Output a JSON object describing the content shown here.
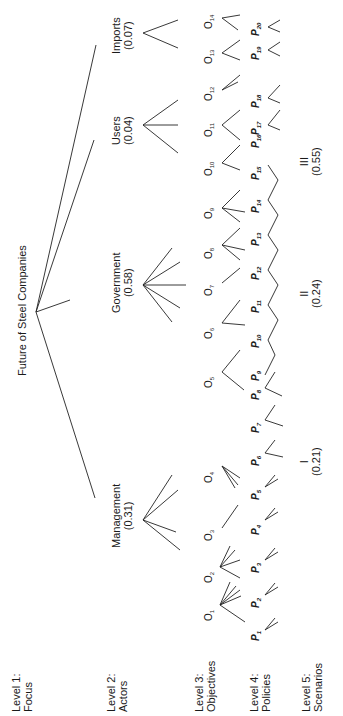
{
  "levels": [
    {
      "title": "Level 1:",
      "name": "Focus"
    },
    {
      "title": "Level 2:",
      "name": "Actors"
    },
    {
      "title": "Level 3:",
      "name": "Objectives"
    },
    {
      "title": "Level 4:",
      "name": "Policies"
    },
    {
      "title": "Level 5:",
      "name": "Scenarios"
    }
  ],
  "focus": {
    "label": "Future of Steel Companies"
  },
  "actors": [
    {
      "name": "Management",
      "weight": "(0.31)"
    },
    {
      "name": "Government",
      "weight": "(0.58)"
    },
    {
      "name": "Users",
      "weight": "(0.04)"
    },
    {
      "name": "Imports",
      "weight": "(0.07)"
    }
  ],
  "objectives": [
    "1",
    "2",
    "3",
    "4",
    "5",
    "6",
    "7",
    "8",
    "9",
    "10",
    "11",
    "12",
    "13",
    "14"
  ],
  "objective_prefix": "O",
  "policies": [
    "1",
    "2",
    "3",
    "4",
    "5",
    "6",
    "7",
    "8",
    "9",
    "10",
    "11",
    "12",
    "13",
    "14",
    "15",
    "16",
    "17",
    "18",
    "19",
    "20"
  ],
  "policy_prefix": "P",
  "scenarios": [
    {
      "name": "I",
      "weight": "(0.21)"
    },
    {
      "name": "II",
      "weight": "(0.24)"
    },
    {
      "name": "III",
      "weight": "(0.55)"
    }
  ]
}
